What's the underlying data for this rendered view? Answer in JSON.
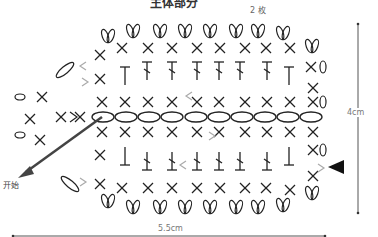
{
  "diagram": {
    "title": "主体部分",
    "count_label": "2 枚",
    "start_label": "开始",
    "height_label": "4cm",
    "width_label": "5.5cm",
    "colors": {
      "ink": "#222222",
      "arrow_grey": "#aaaaaa",
      "dim_line": "#555555"
    }
  }
}
